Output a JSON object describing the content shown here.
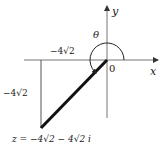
{
  "diagram": {
    "axes": {
      "x_label": "x",
      "y_label": "y",
      "origin_label": "0"
    },
    "angle_label": "θ",
    "horizontal_leg_label": "−4√2",
    "vertical_leg_label": "−4√2",
    "point_label": "z = −4√2 − 4√2 i",
    "colors": {
      "axis": "#555555",
      "vector": "#111111",
      "text": "#1a1a1a",
      "background": "#ffffff"
    }
  }
}
